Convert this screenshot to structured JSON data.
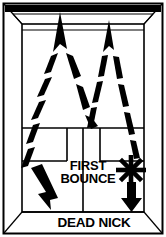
{
  "figure": {
    "kind": "court-perspective-diagram",
    "colors": {
      "ink": "#000000",
      "paper": "#ffffff",
      "line": "#111111"
    }
  },
  "labels": {
    "first_bounce_line1": "FIRST",
    "first_bounce_line2": "BOUNCE",
    "dead_nick": "DEAD NICK"
  },
  "markers": {
    "first_bounce_marker": "starburst-icon",
    "left_shot_arrow": "arrow-up-icon",
    "right_shot_arrow": "arrow-up-icon",
    "left_return_arrow": "arrow-down-right-icon",
    "right_return_arrow": "arrow-down-icon"
  },
  "court": {
    "front_wall": "front-wall",
    "left_wall": "left-wall",
    "right_wall": "right-wall",
    "ceiling": "ceiling",
    "floor": "floor",
    "short_line": "short-line",
    "half_court_line": "half-court-line",
    "left_service_box": "left-service-box",
    "right_service_box": "right-service-box"
  }
}
